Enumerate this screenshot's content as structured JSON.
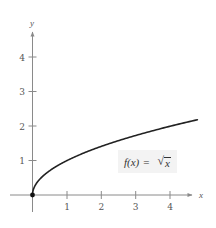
{
  "chart_data": {
    "type": "line",
    "title": "",
    "xlabel": "x",
    "ylabel": "y",
    "xlim": [
      0,
      4.8
    ],
    "ylim": [
      0,
      4.5
    ],
    "x_ticks": [
      "1",
      "2",
      "3",
      "4"
    ],
    "y_ticks": [
      "1",
      "2",
      "3",
      "4"
    ],
    "grid": false,
    "legend": null,
    "series": [
      {
        "name": "f(x) = √x",
        "x": [
          0,
          0.05,
          0.25,
          0.5,
          1,
          1.5,
          2,
          2.5,
          3,
          3.5,
          4,
          4.5,
          4.8
        ],
        "values": [
          0,
          0.224,
          0.5,
          0.707,
          1,
          1.225,
          1.414,
          1.581,
          1.732,
          1.871,
          2,
          2.121,
          2.191
        ]
      }
    ],
    "annotations": [
      {
        "text": "f(x) = √x",
        "position": "near x=3.5, y=0.8",
        "boxed": true
      },
      {
        "text": "closed dot at origin (0, 0)"
      }
    ]
  },
  "labels": {
    "x_axis": "x",
    "y_axis": "y",
    "x_ticks": [
      "1",
      "2",
      "3",
      "4"
    ],
    "y_ticks": [
      "1",
      "2",
      "3",
      "4"
    ],
    "function": {
      "name": "f(x)",
      "equals": "=",
      "radicand": "x"
    }
  },
  "colors": {
    "axis": "#8a8a8a",
    "curve": "#222222",
    "label_bg": "#f3f3f3"
  }
}
